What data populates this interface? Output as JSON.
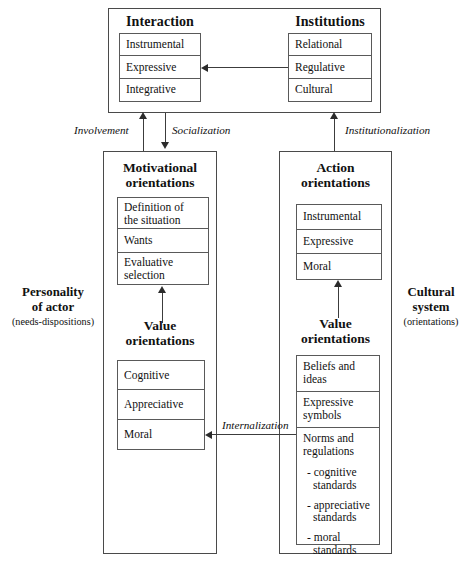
{
  "diagram": {
    "title_top_left": "Interaction",
    "title_top_right": "Institutions",
    "interaction_items": [
      "Instrumental",
      "Expressive",
      "Integrative"
    ],
    "institutions_items": [
      "Relational",
      "Regulative",
      "Cultural"
    ],
    "motivational_title_line1": "Motivational",
    "motivational_title_line2": "orientations",
    "motivational_items": [
      {
        "line1": "Definition of",
        "line2": "the situation"
      },
      {
        "line1": "Wants",
        "line2": ""
      },
      {
        "line1": "Evaluative",
        "line2": "selection"
      }
    ],
    "action_title_line1": "Action",
    "action_title_line2": "orientations",
    "action_items": [
      {
        "line1": "Instrumental",
        "line2": ""
      },
      {
        "line1": "Expressive",
        "line2": ""
      },
      {
        "line1": "Moral",
        "line2": ""
      }
    ],
    "value_left_title_line1": "Value",
    "value_left_title_line2": "orientations",
    "value_left_items": [
      "Cognitive",
      "Appreciative",
      "Moral"
    ],
    "value_right_title_line1": "Value",
    "value_right_title_line2": "orientations",
    "value_right_items": [
      {
        "line1": "Beliefs and",
        "line2": "ideas"
      },
      {
        "line1": "Expressive",
        "line2": "symbols"
      }
    ],
    "norms_heading_line1": "Norms and",
    "norms_heading_line2": "regulations",
    "norms_standards": [
      {
        "line1": "- cognitive",
        "line2": "standards"
      },
      {
        "line1": "- appreciative",
        "line2": "standards"
      },
      {
        "line1": "- moral",
        "line2": "standards"
      }
    ],
    "side_left_line1": "Personality",
    "side_left_line2": "of actor",
    "side_left_paren": "(needs-dispositions)",
    "side_right_line1": "Cultural",
    "side_right_line2": "system",
    "side_right_paren": "(orientations)",
    "edge_involvement": "Involvement",
    "edge_socialization": "Socialization",
    "edge_institutionalization": "Institutionalization",
    "edge_internalization": "Internalization",
    "colors": {
      "ink": "#111111",
      "stroke": "#4a4a4a",
      "background": "#ffffff"
    }
  }
}
